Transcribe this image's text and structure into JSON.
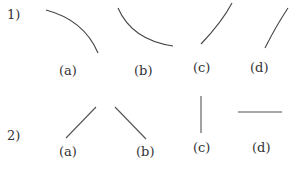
{
  "rows": [
    {
      "number": "1)",
      "items": [
        {
          "label": "(a)",
          "shape": "arc-concave-down"
        },
        {
          "label": "(b)",
          "shape": "arc-concave-up"
        },
        {
          "label": "(c)",
          "shape": "rising-curve"
        },
        {
          "label": "(d)",
          "shape": "rising-curve-steep"
        }
      ]
    },
    {
      "number": "2)",
      "items": [
        {
          "label": "(a)",
          "shape": "line-rising"
        },
        {
          "label": "(b)",
          "shape": "line-falling"
        },
        {
          "label": "(c)",
          "shape": "line-vertical"
        },
        {
          "label": "(d)",
          "shape": "line-horizontal"
        }
      ]
    }
  ],
  "colors": {
    "stroke": "#444444",
    "text": "#333333",
    "background": "#ffffff"
  }
}
